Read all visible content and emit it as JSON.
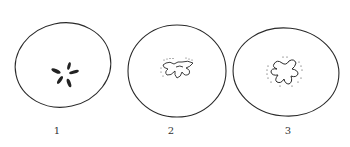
{
  "figure": {
    "panels": [
      {
        "label": "1",
        "core": "five dark filled seed-like marks in a star arrangement"
      },
      {
        "label": "2",
        "core": "outlined lobed core with dotted margin"
      },
      {
        "label": "3",
        "core": "outlined five-lobed star-shaped core with dotted halo"
      }
    ],
    "colors": {
      "stroke": "#2a2a2a",
      "background": "#ffffff"
    }
  }
}
